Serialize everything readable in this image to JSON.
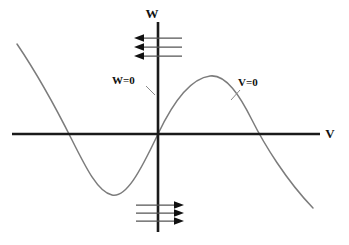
{
  "figure": {
    "background_color": "#ffffff",
    "width": 349,
    "height": 245
  },
  "axes": {
    "vertical": {
      "label": "W",
      "name": "w-axis",
      "color": "#1a1a1a",
      "x": 158,
      "y_top": 22,
      "y_bottom": 232
    },
    "horizontal": {
      "label": "V",
      "name": "v-axis",
      "color": "#1a1a1a",
      "y": 134,
      "x_left": 12,
      "x_right": 320
    },
    "label_positions": {
      "w_label_x": 152,
      "w_label_y": 18,
      "v_label_x": 330,
      "v_label_y": 138
    }
  },
  "annotations": [
    {
      "text": "W=0",
      "name": "w-nullcline-label",
      "x": 112,
      "y": 84,
      "leader": "M 146 86 L 155 95"
    },
    {
      "text": "V=0",
      "name": "v-nullcline-label",
      "x": 238,
      "y": 86,
      "leader": "M 240 90 L 231 100"
    }
  ],
  "curves": [
    {
      "name": "v-nullcline-cubic",
      "description": "Cubic-shaped V=0 nullcline, negative slope at far left and far right, local minimum left of origin, local maximum right of origin, passing through the origin",
      "color": "#7c7c7c",
      "stroke_width": 1.5,
      "path": "M 17 44 C 40 78, 58 112, 72 140 C 86 168, 98 192, 112 195 C 126 198, 140 172, 158 134 C 176 96, 194 78, 210 76 C 226 74, 240 96, 252 120 C 264 144, 286 180, 313 208",
      "key_points": [
        {
          "name": "left-endpoint",
          "x": 17,
          "y": 44
        },
        {
          "name": "left-zero-crossing",
          "x": 65,
          "y": 134
        },
        {
          "name": "local-minimum",
          "x": 112,
          "y": 195
        },
        {
          "name": "origin-crossing",
          "x": 158,
          "y": 134
        },
        {
          "name": "local-maximum",
          "x": 210,
          "y": 76
        },
        {
          "name": "right-zero-crossing",
          "x": 264,
          "y": 134
        },
        {
          "name": "right-endpoint",
          "x": 313,
          "y": 208
        }
      ]
    }
  ],
  "flow_arrows": {
    "upper_group": {
      "name": "upper-flow-arrows",
      "direction": "left",
      "count": 3,
      "x_start": 182,
      "x_end": 136,
      "rows_y": [
        38,
        47,
        56
      ]
    },
    "lower_group": {
      "name": "lower-flow-arrows",
      "direction": "right",
      "count": 3,
      "x_start": 136,
      "x_end": 184,
      "rows_y": [
        205,
        213,
        221
      ]
    }
  },
  "colors": {
    "axis": "#1a1a1a",
    "curve": "#7c7c7c",
    "arrow_shaft": "#555555",
    "arrow_head": "#111111",
    "leader": "#8a8a8a",
    "text": "#111111"
  }
}
